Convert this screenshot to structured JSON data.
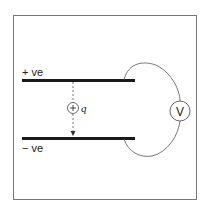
{
  "diagram": {
    "type": "parallel-plate capacitor with voltmeter",
    "top_plate_label": "+ ve",
    "bottom_plate_label": "− ve",
    "charge_symbol": "+",
    "charge_label": "q",
    "meter_label": "V",
    "colors": {
      "frame": "#777777",
      "plate": "#1a1a1a",
      "wire": "#555555",
      "text": "#222222"
    }
  }
}
